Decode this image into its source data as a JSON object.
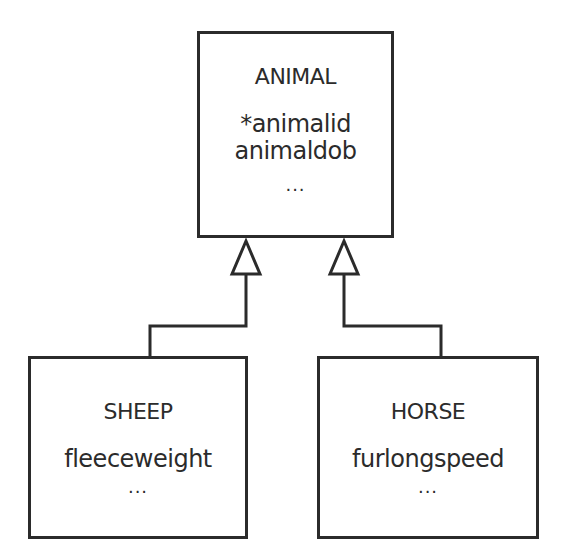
{
  "diagram": {
    "type": "generalization-hierarchy",
    "supertype": {
      "name": "ANIMAL",
      "attributes": [
        "*animalid",
        "animaldob"
      ],
      "more": "..."
    },
    "subtypes": [
      {
        "name": "SHEEP",
        "attributes": [
          "fleeceweight"
        ],
        "more": "..."
      },
      {
        "name": "HORSE",
        "attributes": [
          "furlongspeed"
        ],
        "more": "..."
      }
    ],
    "relationships": [
      {
        "from": "SHEEP",
        "to": "ANIMAL",
        "kind": "is-a (hollow triangle arrow)"
      },
      {
        "from": "HORSE",
        "to": "ANIMAL",
        "kind": "is-a (hollow triangle arrow)"
      }
    ],
    "colors": {
      "line": "#2b2b2b",
      "background": "#ffffff",
      "text": "#2b2b2b"
    }
  }
}
